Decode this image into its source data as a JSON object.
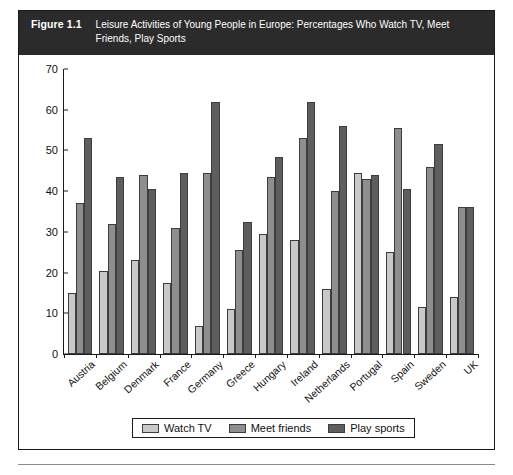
{
  "figure": {
    "label": "Figure 1.1",
    "caption": "Leisure Activities of Young People in Europe: Percentages Who Watch TV, Meet Friends, Play Sports"
  },
  "legend": {
    "position": "bottom-center",
    "items": [
      {
        "label": "Watch TV",
        "color": "#c9c9c9"
      },
      {
        "label": "Meet friends",
        "color": "#8e8e8e"
      },
      {
        "label": "Play sports",
        "color": "#5e5e5e"
      }
    ]
  },
  "chart_data": {
    "type": "bar",
    "title": "Leisure Activities of Young People in Europe: Percentages Who Watch TV, Meet Friends, Play Sports",
    "xlabel": "",
    "ylabel": "",
    "ylim": [
      0,
      70
    ],
    "yticks": [
      0,
      10,
      20,
      30,
      40,
      50,
      60,
      70
    ],
    "grid": false,
    "legend_position": "bottom-center",
    "categories": [
      "Austria",
      "Belgium",
      "Denmark",
      "France",
      "Germany",
      "Greece",
      "Hungary",
      "Ireland",
      "Netherlands",
      "Portugal",
      "Spain",
      "Sweden",
      "UK"
    ],
    "series": [
      {
        "name": "Watch TV",
        "color": "#c9c9c9",
        "values": [
          15,
          20.5,
          23,
          17.5,
          7,
          11,
          29.5,
          28,
          16,
          44.5,
          25,
          11.5,
          14
        ]
      },
      {
        "name": "Meet friends",
        "color": "#8e8e8e",
        "values": [
          37,
          32,
          44,
          31,
          44.5,
          25.5,
          43.5,
          53,
          40,
          43,
          55.5,
          46,
          36
        ]
      },
      {
        "name": "Play sports",
        "color": "#5e5e5e",
        "values": [
          53,
          43.5,
          40.5,
          44.5,
          62,
          32.5,
          48.5,
          62,
          56,
          44,
          40.5,
          51.5,
          36
        ]
      }
    ]
  }
}
